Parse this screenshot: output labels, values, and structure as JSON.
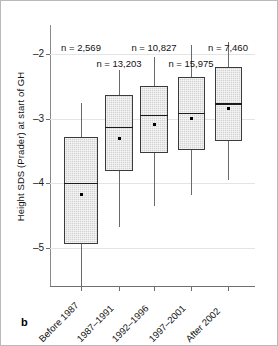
{
  "panel": {
    "letter": "b"
  },
  "chart_data": {
    "type": "box",
    "title": "",
    "xlabel": "",
    "ylabel": "Height SDS (Prader) at start of GH",
    "ylim": [
      -5.6,
      -1.55
    ],
    "yticks": [
      -2,
      -3,
      -4,
      -5
    ],
    "ytick_labels": [
      "–2",
      "–3",
      "–4",
      "–5"
    ],
    "grid": true,
    "legend": "none",
    "categories": [
      "Before 1987",
      "1987–1991",
      "1992–1996",
      "1997–2001",
      "After 2002"
    ],
    "n_labels": [
      "n = 2,569",
      "n = 13,203",
      "n = 10,827",
      "n = 15,975",
      "n = 7,460"
    ],
    "n_values": [
      2569,
      13203,
      10827,
      15975,
      7460
    ],
    "boxes": [
      {
        "category": "Before 1987",
        "whisker_high": -2.75,
        "q3": -3.28,
        "median": -3.99,
        "mean": -4.16,
        "q1": -4.93,
        "whisker_low": -5.65
      },
      {
        "category": "1987–1991",
        "whisker_high": -2.25,
        "q3": -2.63,
        "median": -3.12,
        "mean": -3.3,
        "q1": -3.8,
        "whisker_low": -4.68
      },
      {
        "category": "1992–1996",
        "whisker_high": -2.05,
        "q3": -2.49,
        "median": -2.94,
        "mean": -3.08,
        "q1": -3.53,
        "whisker_low": -4.35
      },
      {
        "category": "1997–2001",
        "whisker_high": -1.86,
        "q3": -2.36,
        "median": -2.91,
        "mean": -2.98,
        "q1": -3.48,
        "whisker_low": -4.18
      },
      {
        "category": "After 2002",
        "whisker_high": -1.81,
        "q3": -2.2,
        "median": -2.76,
        "mean": -2.83,
        "q1": -3.34,
        "whisker_low": -3.95
      }
    ],
    "colors": {
      "box_fill": "#d3d3d3",
      "box_edge": "#3b3b3b",
      "median": "#1b1b1b",
      "whisker": "#6a6a6a",
      "grid": "#e4e4e4",
      "axis": "#6f6f6f",
      "text": "#111111",
      "background": "#ffffff",
      "border": "#b9b9b9"
    }
  }
}
